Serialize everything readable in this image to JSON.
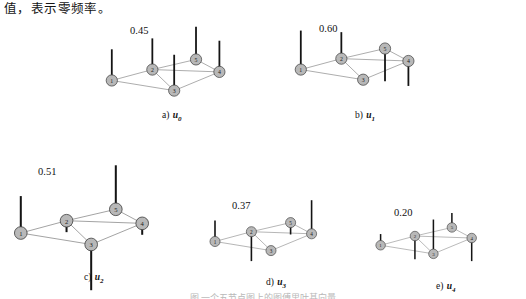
{
  "document": {
    "body_text": "值，表示零频率。",
    "figure_caption": "图 一个五节点图上的图傅里叶基向量"
  },
  "graph": {
    "node_labels": [
      "1",
      "2",
      "3",
      "4",
      "5"
    ],
    "edges": [
      [
        1,
        2
      ],
      [
        1,
        3
      ],
      [
        2,
        3
      ],
      [
        2,
        4
      ],
      [
        2,
        5
      ],
      [
        3,
        4
      ],
      [
        4,
        5
      ]
    ],
    "node_fill": "#b8b8b8",
    "node_stroke": "#3a3a3a",
    "edge_color": "#8a8a8a",
    "stem_color": "#141414"
  },
  "chart_data": {
    "type": "scatter",
    "xlabel": "",
    "ylabel": "",
    "node_positions": {
      "1": [
        10,
        55
      ],
      "2": [
        62,
        41
      ],
      "3": [
        90,
        68
      ],
      "4": [
        148,
        44
      ],
      "5": [
        118,
        28
      ]
    },
    "panels": [
      {
        "id": "u0",
        "caption_prefix": "a)",
        "caption_vector": "u",
        "caption_sub": "0",
        "amplitude_label": "0.45",
        "values": [
          0.45,
          0.45,
          0.45,
          0.45,
          0.45
        ],
        "stems": [
          {
            "node": "1",
            "dir": "up",
            "len": 40
          },
          {
            "node": "2",
            "dir": "up",
            "len": 40
          },
          {
            "node": "3",
            "dir": "up",
            "len": 46
          },
          {
            "node": "4",
            "dir": "up",
            "len": 40
          },
          {
            "node": "5",
            "dir": "up",
            "len": 42
          }
        ]
      },
      {
        "id": "u1",
        "caption_prefix": "b)",
        "caption_vector": "u",
        "caption_sub": "1",
        "amplitude_label": "0.60",
        "values": [
          0.6,
          0.38,
          0.0,
          -0.48,
          -0.52
        ],
        "stems": [
          {
            "node": "1",
            "dir": "up",
            "len": 50
          },
          {
            "node": "2",
            "dir": "up",
            "len": 34
          },
          {
            "node": "3",
            "dir": "none",
            "len": 0
          },
          {
            "node": "4",
            "dir": "down",
            "len": 32
          },
          {
            "node": "5",
            "dir": "down",
            "len": 42
          }
        ]
      },
      {
        "id": "u2",
        "caption_prefix": "c)",
        "caption_vector": "u",
        "caption_sub": "2",
        "amplitude_label": "0.51",
        "values": [
          0.51,
          -0.12,
          -0.62,
          -0.12,
          0.58
        ],
        "stems": [
          {
            "node": "1",
            "dir": "up",
            "len": 42
          },
          {
            "node": "2",
            "dir": "down",
            "len": 13
          },
          {
            "node": "3",
            "dir": "down",
            "len": 52
          },
          {
            "node": "4",
            "dir": "down",
            "len": 13
          },
          {
            "node": "5",
            "dir": "up",
            "len": 50
          }
        ]
      },
      {
        "id": "u3",
        "caption_prefix": "d)",
        "caption_vector": "u",
        "caption_sub": "3",
        "amplitude_label": "0.37",
        "values": [
          0.37,
          -0.52,
          0.0,
          0.6,
          -0.18
        ],
        "stems": [
          {
            "node": "1",
            "dir": "up",
            "len": 30
          },
          {
            "node": "2",
            "dir": "down",
            "len": 42
          },
          {
            "node": "3",
            "dir": "none",
            "len": 0
          },
          {
            "node": "4",
            "dir": "up",
            "len": 48
          },
          {
            "node": "5",
            "dir": "down",
            "len": 17
          }
        ]
      },
      {
        "id": "u4",
        "caption_prefix": "e)",
        "caption_vector": "u",
        "caption_sub": "4",
        "amplitude_label": "0.20",
        "values": [
          0.2,
          -0.42,
          0.62,
          -0.42,
          0.24
        ],
        "stems": [
          {
            "node": "1",
            "dir": "up",
            "len": 17
          },
          {
            "node": "2",
            "dir": "down",
            "len": 35
          },
          {
            "node": "3",
            "dir": "up",
            "len": 52
          },
          {
            "node": "4",
            "dir": "down",
            "len": 35
          },
          {
            "node": "5",
            "dir": "up",
            "len": 22
          }
        ]
      }
    ]
  },
  "layout": {
    "panels": [
      {
        "id": "u0",
        "left": 104,
        "top": 22,
        "scale": 0.78,
        "amp_left": 26,
        "amp_top": 3,
        "cap_left": 58,
        "cap_top": 88
      },
      {
        "id": "u1",
        "left": 293,
        "top": 22,
        "scale": 0.78,
        "amp_left": 26,
        "amp_top": 1,
        "cap_left": 62,
        "cap_top": 88
      },
      {
        "id": "u2",
        "left": 12,
        "top": 160,
        "scale": 0.88,
        "amp_left": 26,
        "amp_top": 6,
        "cap_left": 72,
        "cap_top": 112
      },
      {
        "id": "u3",
        "left": 208,
        "top": 196,
        "scale": 0.7,
        "amp_left": 24,
        "amp_top": 4,
        "cap_left": 58,
        "cap_top": 81
      },
      {
        "id": "u4",
        "left": 374,
        "top": 205,
        "scale": 0.66,
        "amp_left": 20,
        "amp_top": 2,
        "cap_left": 62,
        "cap_top": 76
      }
    ]
  }
}
